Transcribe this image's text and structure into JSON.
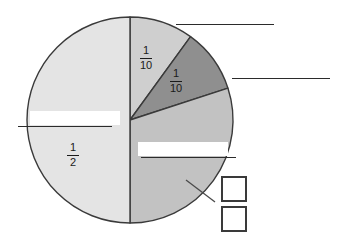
{
  "page": {
    "background_color": "#ffffff",
    "width": 341,
    "height": 240
  },
  "chart_data": {
    "type": "pie",
    "title": "",
    "xlabel": "",
    "ylabel": "",
    "center": [
      130,
      120
    ],
    "radius": 103,
    "start_angle_deg": 0,
    "direction": "clockwise",
    "legend": "none",
    "grid": false,
    "categories": [
      "1/10",
      "1/10",
      "unlabeled",
      "1/2"
    ],
    "values": [
      0.1,
      0.1,
      0.3,
      0.5
    ],
    "labels": [
      "1/10",
      "1/10",
      "",
      "1/2"
    ],
    "slices": [
      {
        "label": "1/10",
        "numerator": "1",
        "denominator": "10",
        "value": 0.1,
        "sweep_deg": 36,
        "start_deg": 0,
        "fill": "#cfcfcf",
        "stroke": "#3a3a3a",
        "label_x": 146,
        "label_y": 45,
        "labeled": true
      },
      {
        "label": "1/10",
        "numerator": "1",
        "denominator": "10",
        "value": 0.1,
        "sweep_deg": 36,
        "start_deg": 36,
        "fill": "#8f8f8f",
        "stroke": "#3a3a3a",
        "label_x": 176,
        "label_y": 68,
        "labeled": true
      },
      {
        "label": "",
        "numerator": "",
        "denominator": "",
        "value": 0.3,
        "sweep_deg": 108,
        "start_deg": 72,
        "fill": "#c2c2c2",
        "stroke": "#3a3a3a",
        "labeled": false
      },
      {
        "label": "1/2",
        "numerator": "1",
        "denominator": "2",
        "value": 0.5,
        "sweep_deg": 180,
        "start_deg": 180,
        "fill": "#e4e4e4",
        "stroke": "#3a3a3a",
        "label_x": 73,
        "label_y": 142,
        "labeled": true
      }
    ]
  },
  "answer_blanks": [
    {
      "name": "answer-line-top-right",
      "x": 176,
      "y": 24,
      "width": 98,
      "whiteout": null
    },
    {
      "name": "answer-line-right",
      "x": 232,
      "y": 78,
      "width": 98,
      "whiteout": null
    },
    {
      "name": "answer-line-left",
      "x": 18,
      "y": 126,
      "width": 94,
      "whiteout": {
        "x": 30,
        "y": 111,
        "width": 90,
        "height": 14
      }
    },
    {
      "name": "answer-line-middle",
      "x": 141,
      "y": 157,
      "width": 95,
      "whiteout": {
        "x": 138,
        "y": 142,
        "width": 90,
        "height": 14
      }
    }
  ],
  "answer_boxes": [
    {
      "name": "fraction-numerator-box",
      "x": 221,
      "y": 176,
      "size": 26
    },
    {
      "name": "fraction-denominator-box",
      "x": 221,
      "y": 206,
      "size": 26
    }
  ],
  "leader_line": {
    "name": "leader-line-to-boxes",
    "x1": 186,
    "y1": 180,
    "x2": 215,
    "y2": 202,
    "color": "#4a4a4a"
  },
  "colors": {
    "slice_half": "#e4e4e4",
    "slice_light_tenth": "#cfcfcf",
    "slice_dark_tenth": "#8f8f8f",
    "slice_three_tenths": "#c2c2c2",
    "outline": "#3a3a3a",
    "text": "#1a1a1a",
    "line": "#2b2b2b"
  }
}
